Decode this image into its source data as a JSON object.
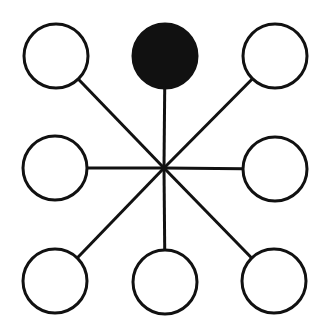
{
  "diagram": {
    "type": "star-network",
    "hub": {
      "x": 164,
      "y": 168
    },
    "node_radius": 32,
    "stroke_color": "#111111",
    "fill_empty": "#ffffff",
    "fill_active": "#111111",
    "nodes": [
      {
        "id": "top-left",
        "x": 56,
        "y": 56,
        "filled": false
      },
      {
        "id": "top-center",
        "x": 165,
        "y": 56,
        "filled": true
      },
      {
        "id": "top-right",
        "x": 275,
        "y": 56,
        "filled": false
      },
      {
        "id": "middle-left",
        "x": 55,
        "y": 168,
        "filled": false
      },
      {
        "id": "middle-right",
        "x": 275,
        "y": 169,
        "filled": false
      },
      {
        "id": "bottom-left",
        "x": 55,
        "y": 281,
        "filled": false
      },
      {
        "id": "bottom-center",
        "x": 165,
        "y": 282,
        "filled": false
      },
      {
        "id": "bottom-right",
        "x": 274,
        "y": 281,
        "filled": false
      }
    ]
  }
}
